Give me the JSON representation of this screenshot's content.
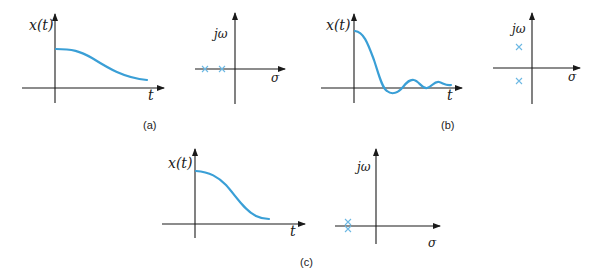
{
  "figure": {
    "colors": {
      "axis": "#1a1a1a",
      "signal": "#3a9fd6",
      "pole": "#6cb8e3"
    },
    "panels": [
      {
        "caption": "(a)",
        "time_plot": {
          "ylabel": "x(t)",
          "xlabel": "t",
          "shape": "smooth monotonic decay (overdamped)"
        },
        "s_plane": {
          "ylabel": "jω",
          "xlabel": "σ",
          "poles": "two distinct real negative poles",
          "pole_marker": "×"
        }
      },
      {
        "caption": "(b)",
        "time_plot": {
          "ylabel": "x(t)",
          "xlabel": "t",
          "shape": "decaying oscillation (underdamped)"
        },
        "s_plane": {
          "ylabel": "jω",
          "xlabel": "σ",
          "poles": "complex conjugate pair in left half-plane",
          "pole_marker": "×"
        }
      },
      {
        "caption": "(c)",
        "time_plot": {
          "ylabel": "x(t)",
          "xlabel": "t",
          "shape": "smooth decay (critically damped)"
        },
        "s_plane": {
          "ylabel": "jω",
          "xlabel": "σ",
          "poles": "repeated real negative pole",
          "pole_marker": "×"
        }
      }
    ]
  }
}
